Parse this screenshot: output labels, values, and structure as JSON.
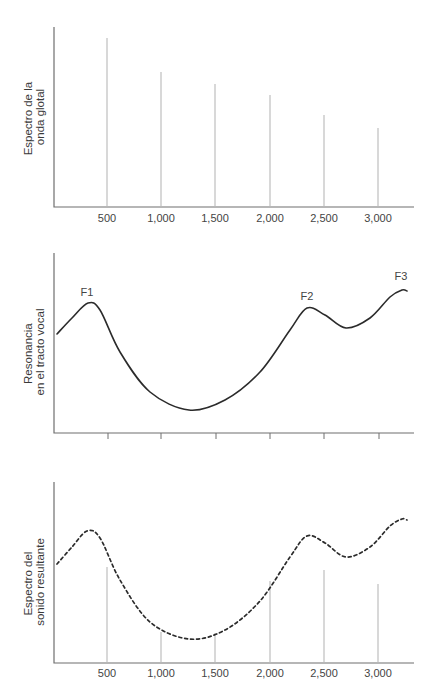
{
  "chart_data": [
    {
      "type": "bar",
      "title": "",
      "ylabel": "Espectro de la onda glotal",
      "ylabel_lines": [
        "Espectro de la",
        "onda glotal"
      ],
      "xlabel": "",
      "categories": [
        "500",
        "1,000",
        "1,500",
        "2,000",
        "2,500",
        "3,000"
      ],
      "x": [
        500,
        1000,
        1500,
        2000,
        2500,
        3000
      ],
      "values": [
        94,
        75,
        68,
        62,
        51,
        44
      ],
      "ylim": [
        0,
        100
      ],
      "grid": false
    },
    {
      "type": "line",
      "title": "",
      "ylabel": "Resonancia en el tracto vocal",
      "ylabel_lines": [
        "Resonancia",
        "en el tracto vocal"
      ],
      "xlabel": "",
      "x": [
        0,
        250,
        500,
        1000,
        1250,
        1500,
        2000,
        2330,
        2700,
        3220,
        3300
      ],
      "values": [
        55,
        72,
        55,
        17,
        13,
        16,
        42,
        69,
        58,
        79,
        78
      ],
      "ylim": [
        0,
        100
      ],
      "annotations": [
        {
          "label": "F1",
          "x": 280
        },
        {
          "label": "F2",
          "x": 2330
        },
        {
          "label": "F3",
          "x": 3220
        }
      ],
      "x_ticks": [
        500,
        1000,
        1500,
        2000,
        2500,
        3000
      ],
      "tick_labels_shown": false,
      "grid": false
    },
    {
      "type": "line",
      "title": "",
      "ylabel": "Espectro del sonido resultante",
      "ylabel_lines": [
        "Espectro del",
        "sonido resultante"
      ],
      "xlabel": "",
      "categories": [
        "500",
        "1,000",
        "1,500",
        "2,000",
        "2,500",
        "3,000"
      ],
      "series": [
        {
          "name": "envolvente (discontinua)",
          "x": [
            0,
            280,
            500,
            1000,
            1250,
            1500,
            2000,
            2330,
            2700,
            3220,
            3300
          ],
          "values": [
            55,
            72,
            53,
            17,
            13,
            16,
            46,
            69,
            58,
            79,
            78
          ]
        },
        {
          "name": "armónicos",
          "x": [
            500,
            1000,
            1500,
            2000,
            2500,
            3000
          ],
          "values": [
            53,
            17,
            16,
            46,
            52,
            44
          ]
        }
      ],
      "ylim": [
        0,
        100
      ],
      "grid": false
    }
  ],
  "panels": {
    "top": {
      "ylabel_lines": [
        "Espectro de la",
        "onda glotal"
      ],
      "tick_labels": [
        "500",
        "1,000",
        "1,500",
        "2,000",
        "2,500",
        "3,000"
      ]
    },
    "middle": {
      "ylabel_lines": [
        "Resonancia",
        "en el tracto vocal"
      ],
      "formants": [
        "F1",
        "F2",
        "F3"
      ]
    },
    "bottom": {
      "ylabel_lines": [
        "Espectro del",
        "sonido resultante"
      ],
      "tick_labels": [
        "500",
        "1,000",
        "1,500",
        "2,000",
        "2,500",
        "3,000"
      ]
    }
  },
  "geometry": {
    "top": {
      "axis": [
        54,
        27,
        207,
        414
      ],
      "bars": [
        [
          107,
          38
        ],
        [
          161,
          72
        ],
        [
          215,
          84
        ],
        [
          270,
          95
        ],
        [
          324,
          115
        ],
        [
          378,
          128
        ]
      ],
      "label_y": 222
    },
    "middle": {
      "axis": [
        54,
        253,
        433,
        414
      ],
      "ticks": [
        108,
        161,
        216,
        270,
        324,
        379
      ],
      "curve": [
        [
          57,
          334
        ],
        [
          72,
          318
        ],
        [
          88,
          303
        ],
        [
          100,
          310
        ],
        [
          120,
          352
        ],
        [
          150,
          392
        ],
        [
          189,
          410
        ],
        [
          225,
          400
        ],
        [
          260,
          372
        ],
        [
          290,
          330
        ],
        [
          307,
          308
        ],
        [
          325,
          315
        ],
        [
          346,
          328
        ],
        [
          370,
          318
        ],
        [
          390,
          297
        ],
        [
          402,
          290
        ],
        [
          407,
          291
        ]
      ],
      "flabels": [
        [
          87,
          296
        ],
        [
          307,
          300
        ],
        [
          401,
          280
        ]
      ]
    },
    "bottom": {
      "axis": [
        54,
        482,
        663,
        414
      ],
      "bars": [
        [
          107,
          567
        ],
        [
          161,
          632
        ],
        [
          215,
          633
        ],
        [
          270,
          581
        ],
        [
          324,
          570
        ],
        [
          378,
          584
        ]
      ],
      "curve": [
        [
          57,
          564
        ],
        [
          72,
          547
        ],
        [
          87,
          531
        ],
        [
          100,
          538
        ],
        [
          120,
          580
        ],
        [
          150,
          622
        ],
        [
          189,
          639
        ],
        [
          225,
          630
        ],
        [
          260,
          601
        ],
        [
          290,
          557
        ],
        [
          307,
          536
        ],
        [
          325,
          543
        ],
        [
          346,
          557
        ],
        [
          370,
          547
        ],
        [
          390,
          526
        ],
        [
          402,
          519
        ],
        [
          407,
          520
        ]
      ],
      "label_y": 677
    }
  }
}
